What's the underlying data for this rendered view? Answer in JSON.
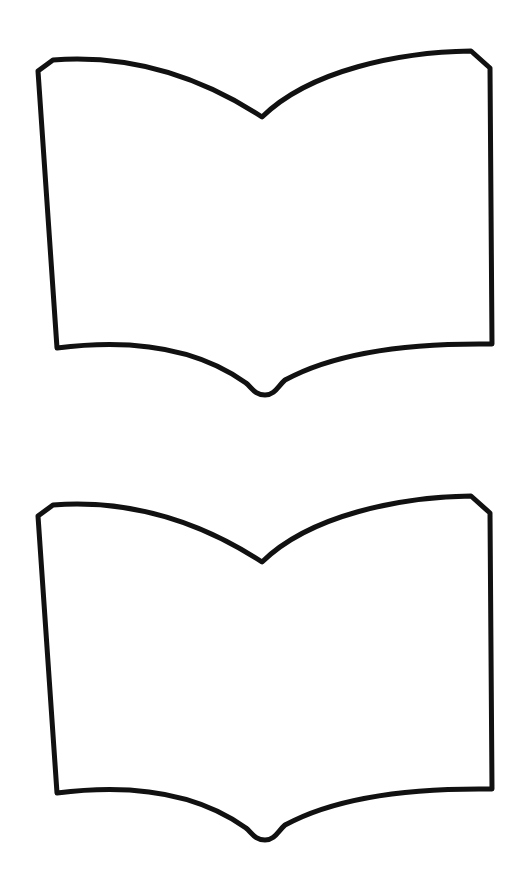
{
  "page": {
    "background": "#ffffff",
    "width": 520,
    "height": 870
  },
  "shapes": [
    {
      "name": "open-book-outline-top",
      "stroke": "#111111",
      "fill": "#ffffff",
      "offset_y": 0
    },
    {
      "name": "open-book-outline-bottom",
      "stroke": "#111111",
      "fill": "#ffffff",
      "offset_y": 445
    }
  ]
}
